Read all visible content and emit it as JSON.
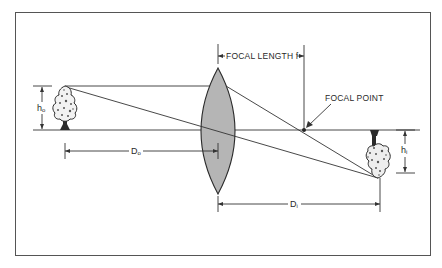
{
  "diagram": {
    "type": "optics-lens-ray-diagram",
    "title": "",
    "labels": {
      "focal_length": "FOCAL LENGTH f",
      "focal_point": "FOCAL POINT",
      "object_height": {
        "main": "h",
        "sub": "o"
      },
      "image_height": {
        "main": "h",
        "sub": "i"
      },
      "object_distance": {
        "main": "D",
        "sub": "o"
      },
      "image_distance": {
        "main": "D",
        "sub": "i"
      }
    },
    "colors": {
      "frame": "#555555",
      "lines": "#333333",
      "lens_fill": "#b5b5b5",
      "tree": "#2b2b2b"
    },
    "elements": [
      "frame",
      "optical-axis",
      "object-tree-upright",
      "convex-lens",
      "image-tree-inverted",
      "ray-parallel-to-axis",
      "ray-through-lens-center",
      "focal-point-marker"
    ]
  }
}
